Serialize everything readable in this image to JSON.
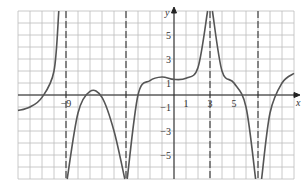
{
  "chart_data": {
    "type": "line",
    "title": "",
    "xlabel": "x",
    "ylabel": "y",
    "xlim": [
      -13,
      10
    ],
    "ylim": [
      -7,
      7
    ],
    "grid": true,
    "x_ticks": [
      {
        "value": -9,
        "label": "−9"
      },
      {
        "value": 1,
        "label": "1"
      },
      {
        "value": 3,
        "label": "3"
      },
      {
        "value": 5,
        "label": "5"
      }
    ],
    "y_ticks": [
      {
        "value": 5,
        "label": "5"
      },
      {
        "value": 3,
        "label": "3"
      },
      {
        "value": 1,
        "label": "1"
      },
      {
        "value": -1,
        "label": "−1"
      },
      {
        "value": -3,
        "label": "−3"
      },
      {
        "value": -5,
        "label": "−5"
      }
    ],
    "vertical_asymptotes": [
      -9,
      -4,
      3,
      7
    ],
    "series": [
      {
        "name": "branch-1",
        "x": [
          -13,
          -12,
          -11,
          -10,
          -9.6
        ],
        "y": [
          -1.3,
          -1,
          -0.2,
          2,
          7
        ]
      },
      {
        "name": "branch-2",
        "x": [
          -8.9,
          -8,
          -7,
          -6,
          -5,
          -4.1
        ],
        "y": [
          -7,
          -1.5,
          0.3,
          -0.2,
          -3,
          -7
        ]
      },
      {
        "name": "branch-3",
        "x": [
          -3.9,
          -3,
          -2,
          -1,
          0,
          1,
          2,
          2.8
        ],
        "y": [
          -7,
          0,
          1.2,
          1.5,
          1.3,
          1.4,
          2.3,
          7
        ]
      },
      {
        "name": "branch-4",
        "x": [
          3.2,
          4,
          5,
          6,
          6.8
        ],
        "y": [
          7,
          2,
          1,
          -1,
          -7
        ]
      },
      {
        "name": "branch-5",
        "x": [
          7.3,
          8,
          9,
          10
        ],
        "y": [
          -7,
          -1.5,
          1,
          1.8
        ]
      }
    ]
  }
}
